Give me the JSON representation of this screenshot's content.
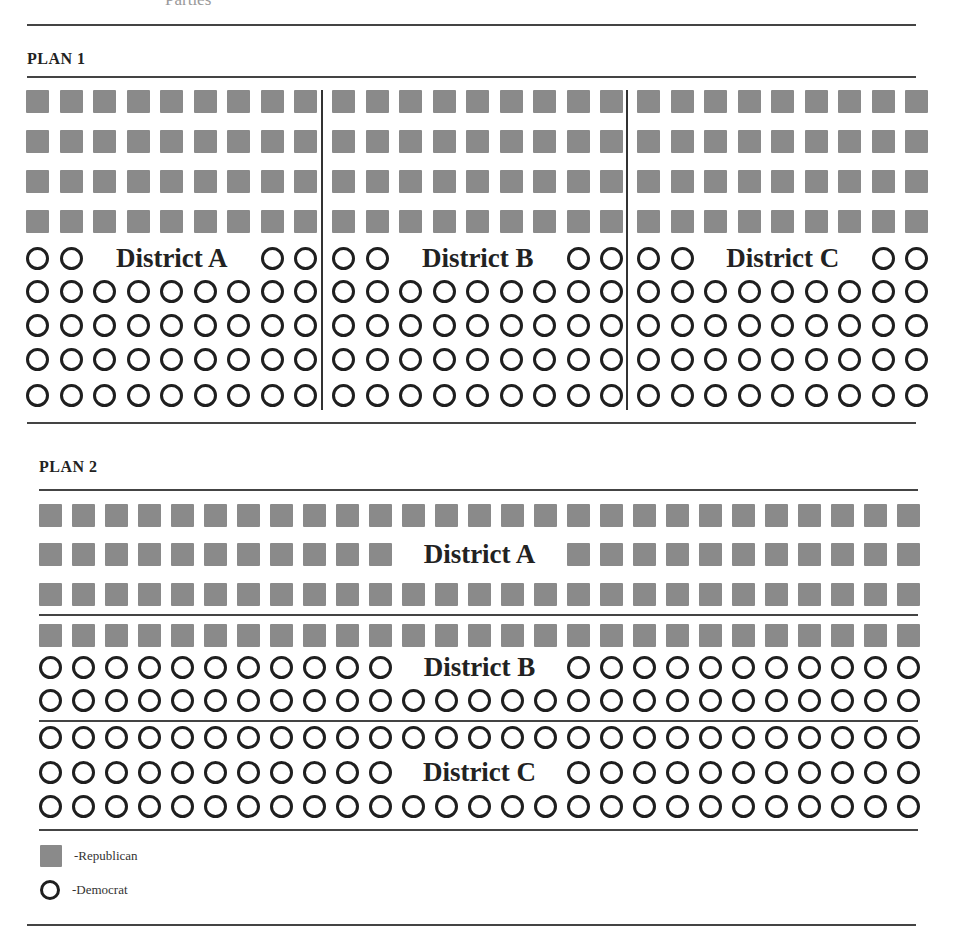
{
  "header": {
    "cut_title": "Parties"
  },
  "plan1": {
    "title": "PLAN 1",
    "districts": [
      {
        "label": "District A"
      },
      {
        "label": "District B"
      },
      {
        "label": "District C"
      }
    ],
    "rows_per_district": [
      "R",
      "R",
      "R",
      "R",
      "D*",
      "D",
      "D",
      "D",
      "D"
    ],
    "columns_per_district": 9
  },
  "plan2": {
    "title": "PLAN 2",
    "columns": 27,
    "rows": [
      {
        "type": "R",
        "district": "A",
        "label": null
      },
      {
        "type": "R",
        "district": "A",
        "label": "District A"
      },
      {
        "type": "R",
        "district": "A",
        "label": null
      },
      {
        "type": "R",
        "district": "B",
        "label": null
      },
      {
        "type": "D",
        "district": "B",
        "label": "District B"
      },
      {
        "type": "D",
        "district": "B",
        "label": null
      },
      {
        "type": "D",
        "district": "C",
        "label": null
      },
      {
        "type": "D",
        "district": "C",
        "label": "District C"
      },
      {
        "type": "D",
        "district": "C",
        "label": null
      }
    ]
  },
  "legend": {
    "republican": "-Republican",
    "democrat": "-Democrat"
  },
  "colors": {
    "republican": "#8a8a8a",
    "democrat_stroke": "#1f1f1f",
    "rule": "#444444"
  }
}
